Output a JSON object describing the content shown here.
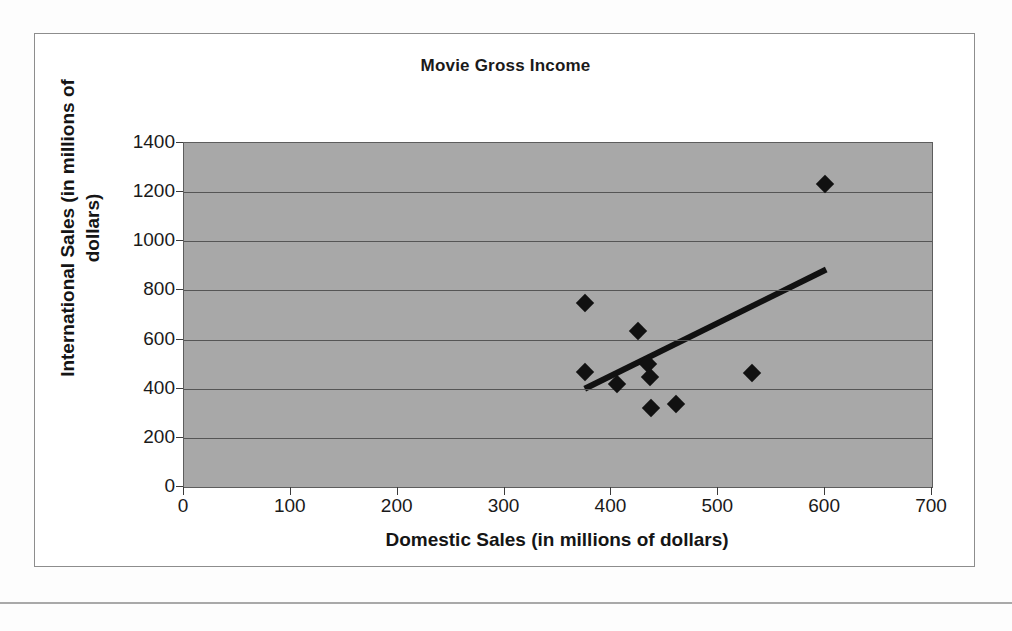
{
  "chart_data": {
    "type": "scatter",
    "title": "Movie Gross Income",
    "xlabel": "Domestic Sales (in millions of dollars)",
    "ylabel": "International Sales (in millions of dollars)",
    "ylabel_line1": "International Sales (in millions of",
    "ylabel_line2": "dollars)",
    "xlim": [
      0,
      700
    ],
    "ylim": [
      0,
      1400
    ],
    "xticks": [
      0,
      100,
      200,
      300,
      400,
      500,
      600,
      700
    ],
    "yticks": [
      0,
      200,
      400,
      600,
      800,
      1000,
      1200,
      1400
    ],
    "xtick_labels": [
      "0",
      "100",
      "200",
      "300",
      "400",
      "500",
      "600",
      "700"
    ],
    "ytick_labels": [
      "0",
      "200",
      "400",
      "600",
      "800",
      "1000",
      "1200",
      "1400"
    ],
    "grid": "horizontal",
    "legend": "none",
    "plot_background": "#a8a8a8",
    "marker_color": "#111111",
    "marker_shape": "diamond",
    "trendline_color": "#111111",
    "points": [
      {
        "x": 375,
        "y": 750
      },
      {
        "x": 375,
        "y": 468
      },
      {
        "x": 405,
        "y": 418
      },
      {
        "x": 425,
        "y": 635
      },
      {
        "x": 434,
        "y": 500
      },
      {
        "x": 436,
        "y": 448
      },
      {
        "x": 437,
        "y": 322
      },
      {
        "x": 460,
        "y": 338
      },
      {
        "x": 532,
        "y": 462
      },
      {
        "x": 600,
        "y": 1235
      }
    ],
    "trendline": {
      "x1": 375,
      "y1": 400,
      "x2": 601,
      "y2": 885
    }
  }
}
